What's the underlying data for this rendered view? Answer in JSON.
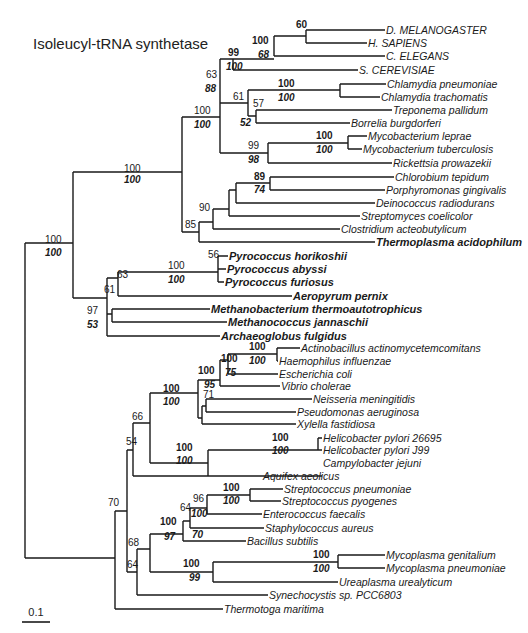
{
  "title": "Isoleucyl-tRNA synthetase",
  "scale_bar": {
    "label": "0.1",
    "x1": 22,
    "x2": 50,
    "y": 622
  },
  "leaves": [
    {
      "id": "dmel",
      "label": "D. MELANOGASTER",
      "x": 385,
      "y": 30,
      "style": "caps"
    },
    {
      "id": "hsap",
      "label": "H. SAPIENS",
      "x": 367,
      "y": 43,
      "style": "caps"
    },
    {
      "id": "cele",
      "label": "C. ELEGANS",
      "x": 385,
      "y": 56,
      "style": "caps"
    },
    {
      "id": "scer",
      "label": "S. CEREVISIAE",
      "x": 358,
      "y": 70,
      "style": "caps"
    },
    {
      "id": "cpne",
      "label": "Chlamydia pneumoniae",
      "x": 386,
      "y": 84,
      "style": ""
    },
    {
      "id": "ctra",
      "label": "Chlamydia trachomatis",
      "x": 380,
      "y": 97,
      "style": ""
    },
    {
      "id": "tpal",
      "label": "Treponema pallidum",
      "x": 392,
      "y": 110,
      "style": ""
    },
    {
      "id": "bbur",
      "label": "Borrelia burgdorferi",
      "x": 350,
      "y": 123,
      "style": ""
    },
    {
      "id": "mlep",
      "label": "Mycobacterium leprae",
      "x": 367,
      "y": 136,
      "style": ""
    },
    {
      "id": "mtub",
      "label": "Mycobacterium tuberculosis",
      "x": 362,
      "y": 149,
      "style": ""
    },
    {
      "id": "rpro",
      "label": "Rickettsia prowazekii",
      "x": 392,
      "y": 163,
      "style": ""
    },
    {
      "id": "ctep",
      "label": "Chlorobium tepidum",
      "x": 394,
      "y": 177,
      "style": ""
    },
    {
      "id": "pgin",
      "label": "Porphyromonas gingivalis",
      "x": 385,
      "y": 190,
      "style": ""
    },
    {
      "id": "drad",
      "label": "Deinococcus radiodurans",
      "x": 375,
      "y": 203,
      "style": ""
    },
    {
      "id": "scoe",
      "label": "Streptomyces coelicolor",
      "x": 360,
      "y": 216,
      "style": ""
    },
    {
      "id": "cace",
      "label": "Clostridium acteobutylicum",
      "x": 340,
      "y": 229,
      "style": ""
    },
    {
      "id": "taci",
      "label": "Thermoplasma acidophilum",
      "x": 375,
      "y": 242,
      "style": "bold"
    },
    {
      "id": "phor",
      "label": "Pyrococcus horikoshii",
      "x": 228,
      "y": 256,
      "style": "bold"
    },
    {
      "id": "paby",
      "label": "Pyrococcus abyssi",
      "x": 226,
      "y": 269,
      "style": "bold"
    },
    {
      "id": "pfur",
      "label": "Pyrococcus furiosus",
      "x": 224,
      "y": 282,
      "style": "bold"
    },
    {
      "id": "aper",
      "label": "Aeropyrum pernix",
      "x": 292,
      "y": 296,
      "style": "bold"
    },
    {
      "id": "mthe",
      "label": "Methanobacterium thermoautotrophicus",
      "x": 210,
      "y": 309,
      "style": "bold"
    },
    {
      "id": "mjan",
      "label": "Methanococcus jannaschii",
      "x": 227,
      "y": 322,
      "style": "bold"
    },
    {
      "id": "aful",
      "label": "Archaeoglobus fulgidus",
      "x": 220,
      "y": 336,
      "style": "bold"
    },
    {
      "id": "aact",
      "label": "Actinobacillus actinomycetemcomitans",
      "x": 300,
      "y": 348,
      "style": ""
    },
    {
      "id": "hinf",
      "label": "Haemophilus influenzae",
      "x": 278,
      "y": 361,
      "style": ""
    },
    {
      "id": "ecol",
      "label": "Escherichia coli",
      "x": 278,
      "y": 374,
      "style": ""
    },
    {
      "id": "vcho",
      "label": "Vibrio cholerae",
      "x": 280,
      "y": 386,
      "style": ""
    },
    {
      "id": "nmen",
      "label": "Neisseria meningitidis",
      "x": 312,
      "y": 399,
      "style": ""
    },
    {
      "id": "paer",
      "label": "Pseudomonas aeruginosa",
      "x": 296,
      "y": 412,
      "style": ""
    },
    {
      "id": "xfas",
      "label": "Xylella fastidiosa",
      "x": 296,
      "y": 424,
      "style": ""
    },
    {
      "id": "hp26",
      "label": "Helicobacter pylori 26695",
      "x": 322,
      "y": 438,
      "style": ""
    },
    {
      "id": "hpj9",
      "label": "Helicobacter pylori J99",
      "x": 322,
      "y": 450,
      "style": ""
    },
    {
      "id": "cjej",
      "label": "Campylobacter jejuni",
      "x": 322,
      "y": 463,
      "style": ""
    },
    {
      "id": "aaeo",
      "label": "Aquifex aeolicus",
      "x": 262,
      "y": 476,
      "style": ""
    },
    {
      "id": "spne",
      "label": "Streptococcus pneumoniae",
      "x": 283,
      "y": 489,
      "style": ""
    },
    {
      "id": "spyo",
      "label": "Streptococcus pyogenes",
      "x": 281,
      "y": 501,
      "style": ""
    },
    {
      "id": "efae",
      "label": "Enterococcus faecalis",
      "x": 262,
      "y": 514,
      "style": ""
    },
    {
      "id": "saur",
      "label": "Staphylococcus aureus",
      "x": 264,
      "y": 528,
      "style": ""
    },
    {
      "id": "bsub",
      "label": "Bacillus subtilis",
      "x": 246,
      "y": 541,
      "style": ""
    },
    {
      "id": "mgen",
      "label": "Mycoplasma genitalium",
      "x": 385,
      "y": 555,
      "style": ""
    },
    {
      "id": "mpne",
      "label": "Mycoplasma pneumoniae",
      "x": 385,
      "y": 568,
      "style": ""
    },
    {
      "id": "uure",
      "label": "Ureaplasma urealyticum",
      "x": 338,
      "y": 582,
      "style": ""
    },
    {
      "id": "syne",
      "label": "Synechocystis sp. PCC6803",
      "x": 268,
      "y": 595,
      "style": ""
    },
    {
      "id": "tmar",
      "label": "Thermotoga maritima",
      "x": 223,
      "y": 609,
      "style": ""
    }
  ],
  "edges": [
    "M25,243 V558",
    "M25,243 H73",
    "M25,558 H115",
    "M73,172 V298",
    "M73,172 H182",
    "M182,117 V232",
    "M182,117 H220",
    "M220,59 V153",
    "M220,59 H233",
    "M233,59 V70",
    "M233,70 H358",
    "M233,59 H274",
    "M274,36 V56",
    "M274,56 H385",
    "M274,36 H306",
    "M306,30 V43",
    "M306,30 H385",
    "M306,43 H367",
    "M220,103 H248",
    "M248,90 V116",
    "M248,90 H340",
    "M340,84 V97",
    "M340,84 H386",
    "M340,97 H380",
    "M248,116 H256",
    "M256,110 V123",
    "M256,110 H392",
    "M256,123 H350",
    "M220,153 H268",
    "M268,143 V163",
    "M268,143 H348",
    "M348,136 V149",
    "M348,136 H367",
    "M348,149 H362",
    "M268,163 H392",
    "M182,232 H199",
    "M199,222 V242",
    "M199,222 H213",
    "M213,209 V229",
    "M213,209 H229",
    "M229,190 V216",
    "M229,190 H236",
    "M236,183 V203",
    "M236,183 H270",
    "M270,177 V190",
    "M270,177 H394",
    "M270,190 H385",
    "M236,203 H375",
    "M229,216 H360",
    "M213,229 H340",
    "M199,242 H375",
    "M73,298 H107",
    "M107,278 V336",
    "M107,278 H118",
    "M118,272 V296",
    "M118,272 H218",
    "M218,256 V282",
    "M218,256 H228",
    "M218,269 H226",
    "M218,282 H224",
    "M118,296 H292",
    "M107,314 H112",
    "M112,309 V322",
    "M112,309 H210",
    "M112,322 H227",
    "M107,336 H220",
    "M115,511 V609",
    "M115,511 H127",
    "M127,450 V572",
    "M127,450 H133",
    "M133,423 V476",
    "M133,423 H150",
    "M150,393 V463",
    "M150,393 H198",
    "M198,380 V418",
    "M198,380 H220",
    "M220,360 V386",
    "M220,360 H228",
    "M228,354 V374",
    "M228,354 H277",
    "M277,348 V361",
    "M277,348 H300",
    "M277,361 H278",
    "M228,374 H278",
    "M220,386 H280",
    "M198,418 H202",
    "M202,406 V424",
    "M202,406 H206",
    "M206,399 V412",
    "M206,399 H312",
    "M206,412 H296",
    "M202,424 H296",
    "M150,463 H208",
    "M208,450 V476",
    "M208,450 H318",
    "M318,438 V450",
    "M318,438 H322",
    "M318,450 H322",
    "M208,476 H322",
    "M133,476 H262",
    "M127,572 H137",
    "M137,549 V595",
    "M137,549 H150",
    "M150,534 V572",
    "M150,534 H183",
    "M183,521 V541",
    "M183,521 H190",
    "M190,508 V528",
    "M190,508 H207",
    "M207,495 V514",
    "M207,495 H250",
    "M250,489 V501",
    "M250,489 H283",
    "M250,501 H281",
    "M207,514 H262",
    "M190,528 H264",
    "M183,541 H246",
    "M150,572 H213",
    "M213,562 V582",
    "M213,562 H338",
    "M338,555 V568",
    "M338,555 H385",
    "M338,568 H385",
    "M213,582 H338",
    "M137,595 H268",
    "M115,609 H223"
  ],
  "bootstrap": [
    {
      "text": "60",
      "x": 296,
      "y": 28,
      "kind": "np"
    },
    {
      "text": "100",
      "x": 252,
      "y": 44,
      "kind": "np"
    },
    {
      "text": "68",
      "x": 258,
      "y": 58,
      "kind": "ml"
    },
    {
      "text": "99",
      "x": 228,
      "y": 56,
      "kind": "np"
    },
    {
      "text": "100",
      "x": 226,
      "y": 70,
      "kind": "ml"
    },
    {
      "text": "63",
      "x": 206,
      "y": 78,
      "kind": ""
    },
    {
      "text": "88",
      "x": 205,
      "y": 92,
      "kind": "ml"
    },
    {
      "text": "61",
      "x": 233,
      "y": 100,
      "kind": ""
    },
    {
      "text": "100",
      "x": 278,
      "y": 87,
      "kind": "np"
    },
    {
      "text": "100",
      "x": 278,
      "y": 101,
      "kind": "ml"
    },
    {
      "text": "57",
      "x": 253,
      "y": 107,
      "kind": ""
    },
    {
      "text": "52",
      "x": 240,
      "y": 126,
      "kind": "ml"
    },
    {
      "text": "100",
      "x": 194,
      "y": 114,
      "kind": ""
    },
    {
      "text": "100",
      "x": 194,
      "y": 128,
      "kind": "ml"
    },
    {
      "text": "100",
      "x": 316,
      "y": 139,
      "kind": "np"
    },
    {
      "text": "100",
      "x": 316,
      "y": 153,
      "kind": "ml"
    },
    {
      "text": "99",
      "x": 248,
      "y": 149,
      "kind": ""
    },
    {
      "text": "98",
      "x": 248,
      "y": 163,
      "kind": "ml"
    },
    {
      "text": "89",
      "x": 254,
      "y": 180,
      "kind": "np"
    },
    {
      "text": "74",
      "x": 254,
      "y": 193,
      "kind": "ml"
    },
    {
      "text": "90",
      "x": 199,
      "y": 211,
      "kind": ""
    },
    {
      "text": "85",
      "x": 185,
      "y": 228,
      "kind": ""
    },
    {
      "text": "100",
      "x": 124,
      "y": 172,
      "kind": ""
    },
    {
      "text": "100",
      "x": 124,
      "y": 183,
      "kind": "ml"
    },
    {
      "text": "100",
      "x": 45,
      "y": 243,
      "kind": ""
    },
    {
      "text": "100",
      "x": 45,
      "y": 256,
      "kind": "ml"
    },
    {
      "text": "56",
      "x": 208,
      "y": 258,
      "kind": ""
    },
    {
      "text": "100",
      "x": 168,
      "y": 269,
      "kind": ""
    },
    {
      "text": "100",
      "x": 168,
      "y": 283,
      "kind": "ml"
    },
    {
      "text": "63",
      "x": 117,
      "y": 278,
      "kind": ""
    },
    {
      "text": "61",
      "x": 104,
      "y": 293,
      "kind": ""
    },
    {
      "text": "97",
      "x": 87,
      "y": 314,
      "kind": ""
    },
    {
      "text": "53",
      "x": 87,
      "y": 328,
      "kind": "ml"
    },
    {
      "text": "100",
      "x": 249,
      "y": 350,
      "kind": "np"
    },
    {
      "text": "100",
      "x": 249,
      "y": 364,
      "kind": "ml"
    },
    {
      "text": "100",
      "x": 221,
      "y": 362,
      "kind": "np"
    },
    {
      "text": "75",
      "x": 225,
      "y": 376,
      "kind": "ml"
    },
    {
      "text": "100",
      "x": 198,
      "y": 374,
      "kind": "np"
    },
    {
      "text": "95",
      "x": 204,
      "y": 388,
      "kind": "ml"
    },
    {
      "text": "71",
      "x": 203,
      "y": 398,
      "kind": ""
    },
    {
      "text": "100",
      "x": 163,
      "y": 392,
      "kind": "np"
    },
    {
      "text": "100",
      "x": 163,
      "y": 405,
      "kind": "ml"
    },
    {
      "text": "66",
      "x": 132,
      "y": 420,
      "kind": ""
    },
    {
      "text": "54",
      "x": 126,
      "y": 445,
      "kind": ""
    },
    {
      "text": "100",
      "x": 272,
      "y": 441,
      "kind": "np"
    },
    {
      "text": "100",
      "x": 272,
      "y": 454,
      "kind": "ml"
    },
    {
      "text": "100",
      "x": 176,
      "y": 451,
      "kind": "np"
    },
    {
      "text": "100",
      "x": 176,
      "y": 464,
      "kind": "ml"
    },
    {
      "text": "70",
      "x": 108,
      "y": 506,
      "kind": ""
    },
    {
      "text": "100",
      "x": 223,
      "y": 491,
      "kind": "np"
    },
    {
      "text": "100",
      "x": 223,
      "y": 504,
      "kind": "ml"
    },
    {
      "text": "96",
      "x": 193,
      "y": 502,
      "kind": ""
    },
    {
      "text": "100",
      "x": 191,
      "y": 517,
      "kind": "ml"
    },
    {
      "text": "64",
      "x": 180,
      "y": 511,
      "kind": ""
    },
    {
      "text": "100",
      "x": 160,
      "y": 525,
      "kind": "np"
    },
    {
      "text": "97",
      "x": 164,
      "y": 540,
      "kind": "ml"
    },
    {
      "text": "70",
      "x": 192,
      "y": 538,
      "kind": "ml"
    },
    {
      "text": "68",
      "x": 128,
      "y": 546,
      "kind": ""
    },
    {
      "text": "64",
      "x": 127,
      "y": 568,
      "kind": ""
    },
    {
      "text": "100",
      "x": 313,
      "y": 558,
      "kind": "np"
    },
    {
      "text": "100",
      "x": 313,
      "y": 572,
      "kind": "ml"
    },
    {
      "text": "100",
      "x": 183,
      "y": 567,
      "kind": "np"
    },
    {
      "text": "99",
      "x": 189,
      "y": 581,
      "kind": "ml"
    }
  ]
}
